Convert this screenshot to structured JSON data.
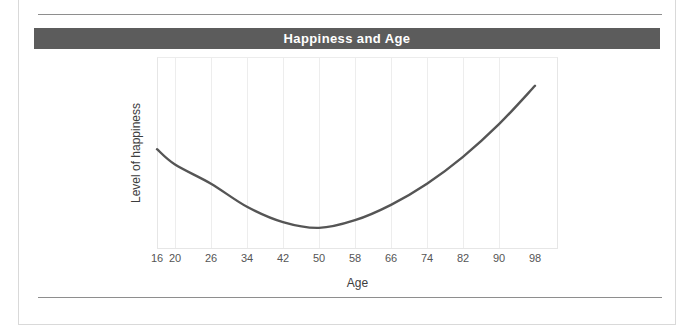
{
  "figure": {
    "title": "Happiness and Age",
    "title_band_color": "#5c5c5c",
    "title_text_color": "#ffffff",
    "background_color": "#ffffff",
    "frame_border_color": "#d9d9d9",
    "rule_color": "#8e8e8e"
  },
  "chart_data": {
    "type": "line",
    "title": "Happiness and Age",
    "xlabel": "Age",
    "ylabel": "Level of happiness",
    "grid": true,
    "legend": null,
    "series_color": "#555555",
    "xlim": [
      16,
      98
    ],
    "ylim": [
      0,
      100
    ],
    "x_tick_labels": [
      "16",
      "20",
      "26",
      "34",
      "42",
      "50",
      "58",
      "66",
      "74",
      "82",
      "90",
      "98"
    ],
    "x": [
      16,
      20,
      26,
      34,
      42,
      50,
      58,
      66,
      74,
      82,
      90,
      98
    ],
    "y_tick_labels": [],
    "series": [
      {
        "name": "Level of happiness",
        "values": [
          52,
          44,
          34,
          22,
          14,
          11,
          15,
          23,
          34,
          48,
          65,
          85
        ],
        "description": "U-shaped curve: happiness declines from age 16 to a minimum near age 48-50, then rises steeply toward age 98"
      }
    ],
    "annotations": []
  },
  "axes": {
    "x_title": "Age",
    "y_title": "Level of happiness",
    "tick_label_color": "#555555",
    "gridline_color": "#ededed",
    "plot_border_color": "#e6e6e6"
  }
}
